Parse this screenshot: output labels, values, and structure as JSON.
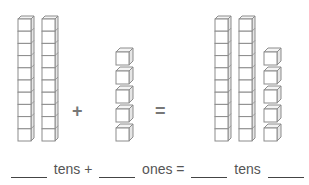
{
  "problem": {
    "left_addend": {
      "tens_rods": 2,
      "ones_cubes": 0
    },
    "right_addend": {
      "tens_rods": 0,
      "ones_cubes": 5
    },
    "result": {
      "tens_rods": 2,
      "ones_cubes": 5
    },
    "cubes_per_rod": 10,
    "plus_symbol": "+",
    "equals_symbol": "="
  },
  "equation": {
    "parts": [
      {
        "type": "blank",
        "name": "blank-tens-1"
      },
      {
        "type": "word",
        "text": "tens +"
      },
      {
        "type": "blank",
        "name": "blank-ones-1"
      },
      {
        "type": "word",
        "text": "ones ="
      },
      {
        "type": "blank",
        "name": "blank-tens-2"
      },
      {
        "type": "word",
        "text": "tens"
      },
      {
        "type": "blank",
        "name": "blank-ones-2"
      },
      {
        "type": "word",
        "text": "ones"
      }
    ],
    "blank_1_value": "",
    "word_1": "tens +",
    "blank_2_value": "",
    "word_2": "ones =",
    "blank_3_value": "",
    "word_3": "tens",
    "blank_4_value": "",
    "word_4": "ones"
  },
  "colors": {
    "stroke": "#8c8c8c",
    "text": "#555555",
    "operator": "#777777",
    "blank_line": "#444444"
  }
}
